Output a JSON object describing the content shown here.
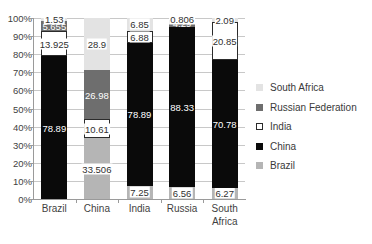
{
  "chart_data": {
    "type": "bar",
    "title": "",
    "xlabel": "",
    "ylabel": "",
    "ylim": [
      0,
      100
    ],
    "stacked": true,
    "grid": true,
    "legend_position": "right",
    "categories": [
      "Brazil",
      "China",
      "India",
      "Russia",
      "South Africa"
    ],
    "y_ticks": [
      "0%",
      "10%",
      "20%",
      "30%",
      "40%",
      "50%",
      "60%",
      "70%",
      "80%",
      "90%",
      "100%"
    ],
    "series": [
      {
        "name": "Brazil",
        "color": "#b5b5b5",
        "values": [
          0,
          33.506,
          7.25,
          6.56,
          6.27
        ]
      },
      {
        "name": "China",
        "color": "#0a0a0a",
        "values": [
          78.89,
          0,
          78.89,
          88.33,
          70.78
        ]
      },
      {
        "name": "India",
        "color": "#ffffff",
        "values": [
          13.925,
          10.61,
          6.88,
          0,
          20.85
        ]
      },
      {
        "name": "Russian Federation",
        "color": "#6e6e6e",
        "values": [
          5.655,
          26.98,
          0,
          4.29,
          0
        ]
      },
      {
        "name": "South Africa",
        "color": "#e3e3e3",
        "values": [
          1.53,
          28.9,
          6.85,
          0.806,
          2.09
        ]
      }
    ],
    "legend_entries": [
      "South Africa",
      "Russian Federation",
      "India",
      "China",
      "Brazil"
    ],
    "data_labels": {
      "Brazil": [
        "1.53",
        "5.655",
        "13.925",
        "78.89"
      ],
      "China": [
        "28.9",
        "26.98",
        "10.61",
        "33.506"
      ],
      "India": [
        "6.85",
        "6.88",
        "78.89",
        "7.25"
      ],
      "Russia": [
        "0.806",
        "4.29",
        "88.33",
        "6.56"
      ],
      "South Africa": [
        "2.09",
        "20.85",
        "70.78",
        "6.27"
      ]
    }
  },
  "legend": {
    "items": [
      {
        "label": "South Africa"
      },
      {
        "label": "Russian Federation"
      },
      {
        "label": "India"
      },
      {
        "label": "China"
      },
      {
        "label": "Brazil"
      }
    ]
  }
}
